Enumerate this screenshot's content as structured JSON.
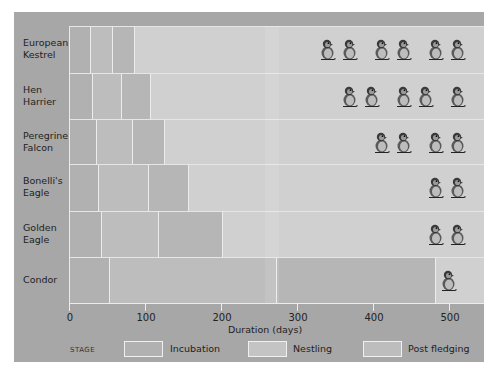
{
  "chart_data": {
    "type": "bar",
    "subtype": "stacked-horizontal",
    "title": "",
    "xlabel": "Duration (days)",
    "ylabel": "",
    "xlim": [
      0,
      550
    ],
    "x_ticks": [
      0,
      100,
      200,
      300,
      400,
      500
    ],
    "categories": [
      "European Kestrel",
      "Hen Harrier",
      "Peregrine Falcon",
      "Bonelli's Eagle",
      "Golden Eagle",
      "Condor"
    ],
    "series": [
      {
        "name": "Incubation",
        "values": [
          29,
          32,
          37,
          39,
          43,
          54
        ]
      },
      {
        "name": "Nestling",
        "values": [
          29,
          38,
          47,
          66,
          75,
          220
        ]
      },
      {
        "name": "Post fledging",
        "values": [
          29,
          38,
          42,
          53,
          85,
          209
        ]
      }
    ],
    "cumulative_end_days": [
      87,
      108,
      126,
      158,
      203,
      483
    ],
    "annotations": {
      "chick_icon_counts": [
        6,
        5,
        4,
        2,
        2,
        1
      ]
    },
    "legend": {
      "title": "STAGE",
      "position": "bottom",
      "entries": [
        "Incubation",
        "Nestling",
        "Post fledging"
      ]
    },
    "grid": false
  },
  "rows": [
    {
      "label_line1": "European",
      "label_line2": "Kestrel"
    },
    {
      "label_line1": "Hen",
      "label_line2": "Harrier"
    },
    {
      "label_line1": "Peregrine",
      "label_line2": "Falcon"
    },
    {
      "label_line1": "Bonelli's",
      "label_line2": "Eagle"
    },
    {
      "label_line1": "Golden",
      "label_line2": "Eagle"
    },
    {
      "label_line1": "Condor",
      "label_line2": ""
    }
  ],
  "axis": {
    "ticks": [
      "0",
      "100",
      "200",
      "300",
      "400",
      "500"
    ],
    "label": "Duration (days)"
  },
  "legend": {
    "title": "STAGE",
    "items": [
      "Incubation",
      "Nestling",
      "Post fledging"
    ]
  },
  "colors": {
    "panel": "#a7a7a7",
    "row_background": "#d0d0d0",
    "incubation": "#b1b1b1",
    "nestling": "#bdbdbd",
    "post_fledging": "#b6b6b6"
  }
}
